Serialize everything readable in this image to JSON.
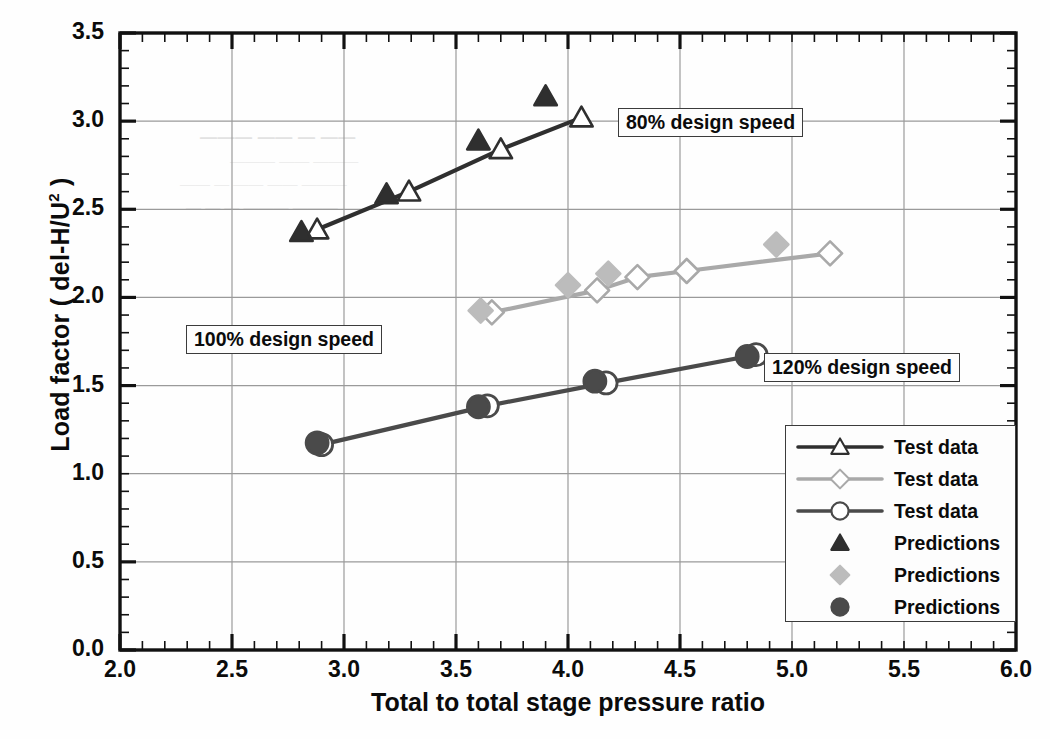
{
  "chart_data": {
    "type": "line",
    "title": "",
    "xlabel": "Total to total  stage pressure ratio",
    "ylabel": "Load factor ( del-H/U",
    "ylabel_sup": "2",
    "ylabel_tail": " )",
    "xlim": [
      2.0,
      6.0
    ],
    "ylim": [
      0.0,
      3.5
    ],
    "xticks": [
      "2.0",
      "2.5",
      "3.0",
      "3.5",
      "4.0",
      "4.5",
      "5.0",
      "5.5",
      "6.0"
    ],
    "xtick_values": [
      2.0,
      2.5,
      3.0,
      3.5,
      4.0,
      4.5,
      5.0,
      5.5,
      6.0
    ],
    "yticks": [
      "0.0",
      "0.5",
      "1.0",
      "1.5",
      "2.0",
      "2.5",
      "3.0",
      "3.5"
    ],
    "ytick_values": [
      0.0,
      0.5,
      1.0,
      1.5,
      2.0,
      2.5,
      3.0,
      3.5
    ],
    "xminor_step": 0.1,
    "yminor_step": 0.1,
    "grid": true,
    "legend_position": "lower-right",
    "series": [
      {
        "name": "Test data",
        "label": "Test data",
        "group": "80% design speed",
        "marker": "open-triangle",
        "color": "#2f2f2f",
        "line": true,
        "points": [
          {
            "x": 2.88,
            "y": 2.385
          },
          {
            "x": 3.29,
            "y": 2.6
          },
          {
            "x": 3.7,
            "y": 2.84
          },
          {
            "x": 4.06,
            "y": 3.02
          }
        ]
      },
      {
        "name": "Test data",
        "label": "Test data",
        "group": "100% design speed",
        "marker": "open-diamond",
        "color": "#a9a9a9",
        "line": true,
        "points": [
          {
            "x": 3.66,
            "y": 1.915
          },
          {
            "x": 4.13,
            "y": 2.04
          },
          {
            "x": 4.31,
            "y": 2.115
          },
          {
            "x": 4.53,
            "y": 2.15
          },
          {
            "x": 5.17,
            "y": 2.25
          }
        ]
      },
      {
        "name": "Test data",
        "label": "Test data",
        "group": "120% design speed",
        "marker": "open-circle",
        "color": "#4a4a4a",
        "line": true,
        "points": [
          {
            "x": 2.9,
            "y": 1.165
          },
          {
            "x": 3.64,
            "y": 1.385
          },
          {
            "x": 4.17,
            "y": 1.515
          },
          {
            "x": 4.84,
            "y": 1.675
          }
        ]
      },
      {
        "name": "Predictions",
        "label": "Predictions",
        "group": "80% design speed",
        "marker": "filled-triangle",
        "color": "#2f2f2f",
        "line": false,
        "points": [
          {
            "x": 2.81,
            "y": 2.37
          },
          {
            "x": 3.19,
            "y": 2.585
          },
          {
            "x": 3.6,
            "y": 2.89
          },
          {
            "x": 3.9,
            "y": 3.14
          }
        ]
      },
      {
        "name": "Predictions",
        "label": "Predictions",
        "group": "100% design speed",
        "marker": "filled-diamond",
        "color": "#bcbcbc",
        "line": false,
        "points": [
          {
            "x": 3.61,
            "y": 1.925
          },
          {
            "x": 4.0,
            "y": 2.07
          },
          {
            "x": 4.18,
            "y": 2.135
          },
          {
            "x": 4.93,
            "y": 2.3
          }
        ]
      },
      {
        "name": "Predictions",
        "label": "Predictions",
        "group": "120% design speed",
        "marker": "filled-circle",
        "color": "#4a4a4a",
        "line": false,
        "points": [
          {
            "x": 2.88,
            "y": 1.175
          },
          {
            "x": 3.6,
            "y": 1.38
          },
          {
            "x": 4.12,
            "y": 1.525
          },
          {
            "x": 4.8,
            "y": 1.665
          }
        ]
      }
    ],
    "annotations": [
      {
        "text": "80% design speed",
        "x_px": 618,
        "y_px": 108,
        "name": "annotation-80-design-speed"
      },
      {
        "text": "100% design speed",
        "x_px": 186,
        "y_px": 325,
        "name": "annotation-100-design-speed"
      },
      {
        "text": "120% design speed",
        "x_px": 764,
        "y_px": 353,
        "name": "annotation-120-design-speed"
      }
    ],
    "legend_entries": [
      {
        "label": "Test data",
        "marker": "open-triangle",
        "color": "#2f2f2f",
        "line": true
      },
      {
        "label": "Test data",
        "marker": "open-diamond",
        "color": "#a9a9a9",
        "line": true
      },
      {
        "label": "Test data",
        "marker": "open-circle",
        "color": "#4a4a4a",
        "line": true
      },
      {
        "label": "Predictions",
        "marker": "filled-triangle",
        "color": "#2f2f2f",
        "line": false
      },
      {
        "label": "Predictions",
        "marker": "filled-diamond",
        "color": "#bcbcbc",
        "line": false
      },
      {
        "label": "Predictions",
        "marker": "filled-circle",
        "color": "#4a4a4a",
        "line": false
      }
    ]
  },
  "style": {
    "axis_color": "#111111",
    "grid_color": "#9a9a9a",
    "background": "#fefefe",
    "text_color": "#0b0b0b"
  },
  "plot_box": {
    "left": 120,
    "top": 33,
    "right": 1016,
    "bottom": 650
  }
}
